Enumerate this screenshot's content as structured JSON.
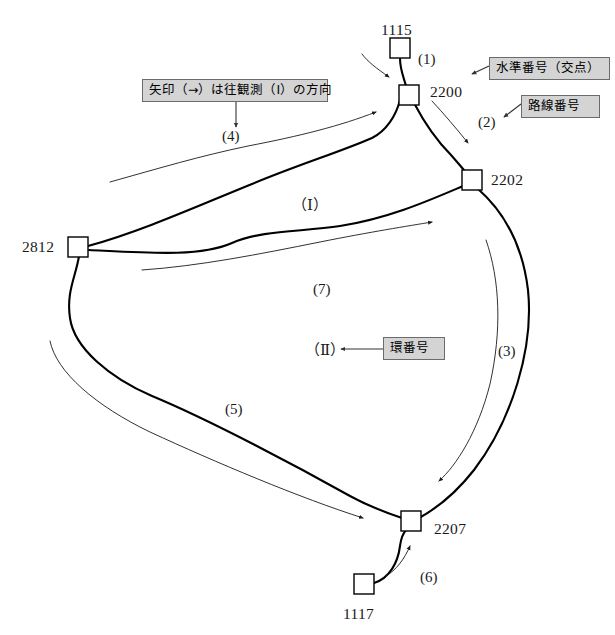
{
  "diagram": {
    "type": "leveling-network",
    "background_color": "#ffffff",
    "line_color": "#000000",
    "callout_fill": "#d4d4d4",
    "callout_border": "#6b6b6b"
  },
  "nodes": [
    {
      "id": "n1115",
      "label": "1115",
      "kind": "bench-mark",
      "x": 400,
      "y": 48,
      "label_x": 381,
      "label_y": 22
    },
    {
      "id": "n2200",
      "label": "2200",
      "kind": "junction",
      "x": 409,
      "y": 94,
      "label_x": 430,
      "label_y": 84
    },
    {
      "id": "n2202",
      "label": "2202",
      "kind": "junction",
      "x": 472,
      "y": 180,
      "label_x": 491,
      "label_y": 172
    },
    {
      "id": "n2812",
      "label": "2812",
      "kind": "junction",
      "x": 78,
      "y": 247,
      "label_x": 22,
      "label_y": 239
    },
    {
      "id": "n2207",
      "label": "2207",
      "kind": "junction",
      "x": 411,
      "y": 521,
      "label_x": 434,
      "label_y": 521
    },
    {
      "id": "n1117",
      "label": "1117",
      "kind": "bench-mark",
      "x": 364,
      "y": 584,
      "label_x": 343,
      "label_y": 606
    }
  ],
  "routes": [
    {
      "id": "r1",
      "label": "(1)",
      "label_x": 418,
      "label_y": 52
    },
    {
      "id": "r2",
      "label": "(2)",
      "label_x": 478,
      "label_y": 115
    },
    {
      "id": "r3",
      "label": "(3)",
      "label_x": 498,
      "label_y": 344
    },
    {
      "id": "r4",
      "label": "(4)",
      "label_x": 222,
      "label_y": 129
    },
    {
      "id": "r5",
      "label": "(5)",
      "label_x": 225,
      "label_y": 402
    },
    {
      "id": "r6",
      "label": "(6)",
      "label_x": 420,
      "label_y": 570
    },
    {
      "id": "r7",
      "label": "(7)",
      "label_x": 313,
      "label_y": 282
    }
  ],
  "rings": [
    {
      "id": "ring1",
      "label": "（Ⅰ）",
      "label_x": 292,
      "label_y": 198
    },
    {
      "id": "ring2",
      "label": "（Ⅱ）",
      "label_x": 305,
      "label_y": 343
    }
  ],
  "callouts": [
    {
      "id": "c-bench-number",
      "text": "水準番号（交点）",
      "box_x": 489,
      "box_y": 57,
      "box_w": 121,
      "box_h": 23,
      "arrow_tip_x": 469,
      "arrow_tip_y": 75
    },
    {
      "id": "c-route-number",
      "text": "路線番号",
      "box_x": 521,
      "box_y": 95,
      "box_w": 79,
      "box_h": 23,
      "arrow_tip_x": 501,
      "arrow_tip_y": 118
    },
    {
      "id": "c-direction-note",
      "text": "矢印（→）は往観測（Ⅰ）の方向",
      "box_x": 142,
      "box_y": 79,
      "box_w": 186,
      "box_h": 23,
      "arrow_tip_x": 236,
      "arrow_tip_y": 130
    },
    {
      "id": "c-ring-number",
      "text": "環番号",
      "box_x": 383,
      "box_y": 337,
      "box_w": 62,
      "box_h": 23,
      "arrow_tip_x": 338,
      "arrow_tip_y": 349
    }
  ]
}
